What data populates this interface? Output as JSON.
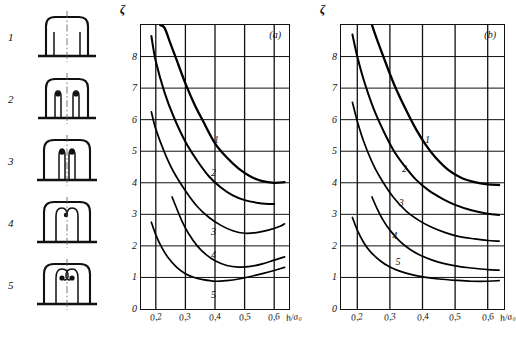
{
  "figure": {
    "sketches": [
      {
        "index": "1",
        "name": "plain-straight-passage"
      },
      {
        "index": "2",
        "name": "passage-with-thin-slots"
      },
      {
        "index": "3",
        "name": "passage-with-deep-slots"
      },
      {
        "index": "4",
        "name": "passage-with-hooked-slots"
      },
      {
        "index": "5",
        "name": "passage-with-double-hooked-slots"
      }
    ],
    "charts": [
      {
        "tag": "(a)",
        "name": "chart-a",
        "ylabel": "ζ",
        "xlabel": "h/a₀",
        "yticks": [
          "0",
          "1",
          "2",
          "3",
          "4",
          "5",
          "6",
          "7",
          "8"
        ],
        "xticks": [
          "0,2",
          "0,3",
          "0,4",
          "0,5",
          "0,6"
        ],
        "curve_labels": [
          "1",
          "2",
          "3",
          "4",
          "5"
        ]
      },
      {
        "tag": "(b)",
        "name": "chart-b",
        "ylabel": "ζ",
        "xlabel": "h/a₀",
        "yticks": [
          "0",
          "1",
          "2",
          "3",
          "4",
          "5",
          "6",
          "7",
          "8"
        ],
        "xticks": [
          "0,2",
          "0,3",
          "0,4",
          "0,5",
          "0,6"
        ],
        "curve_labels": [
          "1",
          "2",
          "3",
          "4",
          "5"
        ]
      }
    ]
  },
  "chart_data": [
    {
      "type": "line",
      "name": "chart-a",
      "title": "(a)",
      "xlabel": "h/a₀",
      "ylabel": "ζ",
      "xlim": [
        0.15,
        0.65
      ],
      "ylim": [
        0,
        9
      ],
      "xticks": [
        0.2,
        0.3,
        0.4,
        0.5,
        0.6
      ],
      "xticklabels": [
        "0,2",
        "0,3",
        "0,4",
        "0,5",
        "0,6"
      ],
      "yticks": [
        0,
        1,
        2,
        3,
        4,
        5,
        6,
        7,
        8
      ],
      "yticklabels": [
        "0",
        "1",
        "2",
        "3",
        "4",
        "5",
        "6",
        "7",
        "8"
      ],
      "grid": true,
      "legend": "inline-curve-numbers",
      "series": [
        {
          "name": "1",
          "label_at": {
            "x": 0.405,
            "y": 5.35
          },
          "x": [
            0.215,
            0.23,
            0.25,
            0.27,
            0.3,
            0.33,
            0.36,
            0.4,
            0.44,
            0.48,
            0.52,
            0.56,
            0.6,
            0.635
          ],
          "values": [
            9.0,
            8.9,
            8.4,
            7.9,
            7.15,
            6.5,
            5.95,
            5.25,
            4.8,
            4.45,
            4.2,
            4.05,
            4.0,
            4.02
          ]
        },
        {
          "name": "2",
          "label_at": {
            "x": 0.395,
            "y": 4.3
          },
          "x": [
            0.185,
            0.2,
            0.23,
            0.26,
            0.3,
            0.34,
            0.38,
            0.42,
            0.46,
            0.5,
            0.54,
            0.58,
            0.6
          ],
          "values": [
            8.65,
            7.85,
            6.85,
            6.1,
            5.3,
            4.7,
            4.2,
            3.85,
            3.6,
            3.45,
            3.37,
            3.33,
            3.33
          ]
        },
        {
          "name": "3",
          "label_at": {
            "x": 0.395,
            "y": 2.45
          },
          "x": [
            0.185,
            0.2,
            0.23,
            0.26,
            0.3,
            0.34,
            0.38,
            0.42,
            0.46,
            0.5,
            0.54,
            0.58,
            0.62,
            0.635
          ],
          "values": [
            6.25,
            5.7,
            4.95,
            4.35,
            3.75,
            3.25,
            2.9,
            2.65,
            2.48,
            2.4,
            2.42,
            2.5,
            2.62,
            2.7
          ]
        },
        {
          "name": "4",
          "label_at": {
            "x": 0.395,
            "y": 1.72
          },
          "x": [
            0.255,
            0.27,
            0.29,
            0.31,
            0.34,
            0.37,
            0.4,
            0.44,
            0.48,
            0.52,
            0.56,
            0.6,
            0.635
          ],
          "values": [
            3.55,
            3.2,
            2.75,
            2.4,
            2.0,
            1.72,
            1.53,
            1.38,
            1.33,
            1.35,
            1.43,
            1.55,
            1.65
          ]
        },
        {
          "name": "5",
          "label_at": {
            "x": 0.395,
            "y": 0.45
          },
          "x": [
            0.185,
            0.2,
            0.22,
            0.24,
            0.27,
            0.3,
            0.33,
            0.36,
            0.4,
            0.44,
            0.48,
            0.52,
            0.56,
            0.6,
            0.635
          ],
          "values": [
            2.75,
            2.35,
            1.95,
            1.65,
            1.33,
            1.12,
            1.0,
            0.93,
            0.88,
            0.9,
            0.95,
            1.03,
            1.12,
            1.22,
            1.32
          ]
        }
      ]
    },
    {
      "type": "line",
      "name": "chart-b",
      "title": "(b)",
      "xlabel": "h/a₀",
      "ylabel": "ζ",
      "xlim": [
        0.15,
        0.65
      ],
      "ylim": [
        0,
        9
      ],
      "xticks": [
        0.2,
        0.3,
        0.4,
        0.5,
        0.6
      ],
      "xticklabels": [
        "0,2",
        "0,3",
        "0,4",
        "0,5",
        "0,6"
      ],
      "yticks": [
        0,
        1,
        2,
        3,
        4,
        5,
        6,
        7,
        8
      ],
      "yticklabels": [
        "0",
        "1",
        "2",
        "3",
        "4",
        "5",
        "6",
        "7",
        "8"
      ],
      "grid": true,
      "legend": "inline-curve-numbers",
      "series": [
        {
          "name": "1",
          "label_at": {
            "x": 0.415,
            "y": 5.35
          },
          "x": [
            0.245,
            0.26,
            0.28,
            0.3,
            0.32,
            0.35,
            0.38,
            0.41,
            0.44,
            0.48,
            0.52,
            0.56,
            0.6,
            0.635
          ],
          "values": [
            9.0,
            8.55,
            8.0,
            7.45,
            6.95,
            6.3,
            5.7,
            5.2,
            4.8,
            4.4,
            4.15,
            4.02,
            3.95,
            3.93
          ]
        },
        {
          "name": "2",
          "label_at": {
            "x": 0.345,
            "y": 4.45
          },
          "x": [
            0.185,
            0.2,
            0.22,
            0.25,
            0.28,
            0.31,
            0.34,
            0.38,
            0.42,
            0.46,
            0.5,
            0.55,
            0.6,
            0.635
          ],
          "values": [
            8.7,
            8.0,
            7.25,
            6.35,
            5.65,
            5.05,
            4.6,
            4.1,
            3.75,
            3.5,
            3.3,
            3.13,
            3.02,
            2.98
          ]
        },
        {
          "name": "3",
          "label_at": {
            "x": 0.335,
            "y": 3.35
          },
          "x": [
            0.185,
            0.2,
            0.22,
            0.25,
            0.28,
            0.31,
            0.35,
            0.39,
            0.43,
            0.47,
            0.51,
            0.56,
            0.6,
            0.635
          ],
          "values": [
            6.55,
            5.95,
            5.3,
            4.55,
            4.0,
            3.55,
            3.1,
            2.8,
            2.58,
            2.42,
            2.3,
            2.22,
            2.17,
            2.15
          ]
        },
        {
          "name": "4",
          "label_at": {
            "x": 0.315,
            "y": 2.3
          },
          "x": [
            0.245,
            0.26,
            0.28,
            0.3,
            0.33,
            0.36,
            0.39,
            0.43,
            0.47,
            0.51,
            0.55,
            0.6,
            0.635
          ],
          "values": [
            3.55,
            3.2,
            2.8,
            2.5,
            2.15,
            1.9,
            1.72,
            1.55,
            1.43,
            1.35,
            1.3,
            1.25,
            1.23
          ]
        },
        {
          "name": "5",
          "label_at": {
            "x": 0.325,
            "y": 1.5
          },
          "x": [
            0.185,
            0.2,
            0.22,
            0.24,
            0.27,
            0.3,
            0.33,
            0.37,
            0.41,
            0.45,
            0.5,
            0.55,
            0.6,
            0.635
          ],
          "values": [
            2.9,
            2.5,
            2.1,
            1.82,
            1.53,
            1.33,
            1.2,
            1.08,
            1.0,
            0.95,
            0.91,
            0.88,
            0.88,
            0.9
          ]
        }
      ]
    }
  ]
}
